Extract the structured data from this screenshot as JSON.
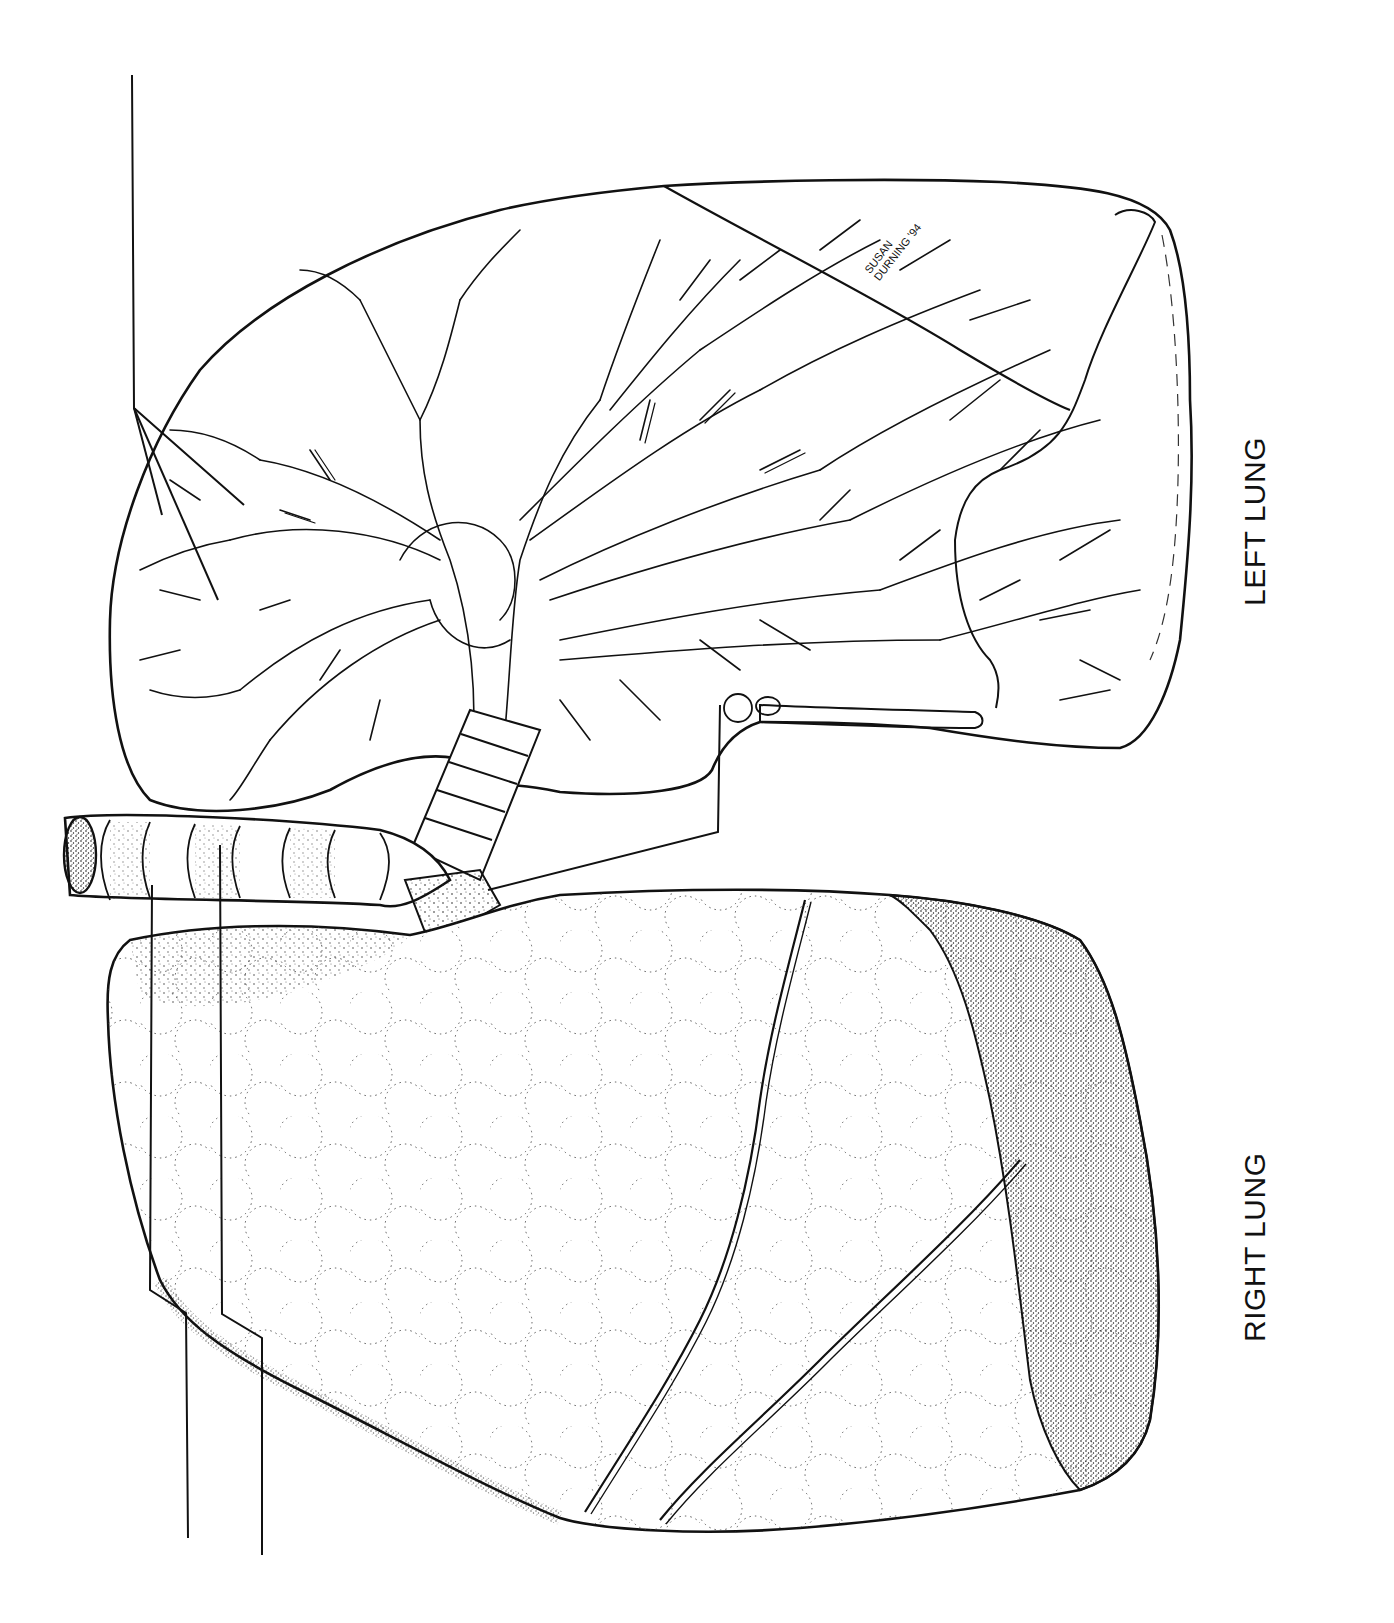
{
  "figure": {
    "orientation": "rotated 90 degrees counter-clockwise",
    "background_color": "#ffffff",
    "ink_color": "#111111"
  },
  "labels": {
    "left_lung": "LEFT LUNG",
    "right_lung": "RIGHT LUNG"
  },
  "signature": {
    "line1": "SUSAN",
    "line2": "DURNING",
    "year": "'94"
  },
  "leader_lines": [
    {
      "id": "bronchial-tree",
      "points": [
        [
          132,
          75
        ],
        [
          134,
          408
        ],
        [
          162,
          515
        ],
        [
          244,
          505
        ],
        [
          218,
          600
        ]
      ],
      "target": "bronchial branches (three-pronged)"
    },
    {
      "id": "bronchus-right",
      "points": [
        [
          720,
          705
        ],
        [
          718,
          832
        ],
        [
          488,
          890
        ]
      ],
      "target": "primary bronchus"
    },
    {
      "id": "trachea-a",
      "points": [
        [
          152,
          885
        ],
        [
          150,
          1290
        ],
        [
          186,
          1313
        ],
        [
          188,
          1538
        ]
      ],
      "target": "trachea"
    },
    {
      "id": "trachea-b",
      "points": [
        [
          220,
          845
        ],
        [
          222,
          1314
        ],
        [
          262,
          1338
        ],
        [
          262,
          1555
        ]
      ],
      "target": "tracheal cartilage ring"
    }
  ],
  "structures": [
    {
      "name": "left-lung",
      "style": "outline with bronchial tree"
    },
    {
      "name": "right-lung",
      "style": "stippled alveolar lobes"
    },
    {
      "name": "trachea",
      "style": "ringed cartilage tube"
    },
    {
      "name": "horizontal-fissure"
    },
    {
      "name": "oblique-fissure"
    }
  ]
}
